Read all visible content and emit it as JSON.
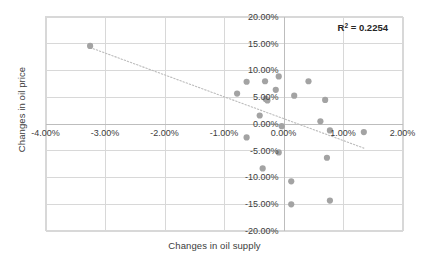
{
  "chart_data": {
    "type": "scatter",
    "title": "",
    "xlabel": "Changes in oil supply",
    "ylabel": "Changes in oil price",
    "xlim": [
      -4.0,
      2.0
    ],
    "ylim": [
      -20.0,
      20.0
    ],
    "x_ticks": [
      -4.0,
      -3.0,
      -2.0,
      -1.0,
      0.0,
      1.0,
      2.0
    ],
    "x_tick_labels": [
      "-4.00%",
      "-3.00%",
      "-2.00%",
      "-1.00%",
      "0.00%",
      "1.00%",
      "2.00%"
    ],
    "y_ticks": [
      20.0,
      15.0,
      10.0,
      5.0,
      0.0,
      -5.0,
      -10.0,
      -15.0,
      -20.0
    ],
    "y_tick_labels": [
      "20.00%",
      "15.00%",
      "10.00%",
      "5.00%",
      "0.00%",
      "-5.00%",
      "-10.00%",
      "-15.00%",
      "-20.00%"
    ],
    "grid": true,
    "legend": false,
    "annotation": "R² = 0.2254",
    "annotation_prefix": "R",
    "annotation_superscript": "2",
    "annotation_suffix": " = 0.2254",
    "r_squared": 0.2254,
    "marker_color": "#a3a3a3",
    "gridline_color": "#d8d8d8",
    "trendline_color": "#bcbcbc",
    "trendline": {
      "style": "dotted",
      "x_start": -3.25,
      "y_start": 14.2,
      "x_end": 1.35,
      "y_end": -4.6
    },
    "points": [
      {
        "x": -3.25,
        "y": 14.5
      },
      {
        "x": -0.62,
        "y": 7.8
      },
      {
        "x": -0.31,
        "y": 7.9
      },
      {
        "x": -0.08,
        "y": 8.8
      },
      {
        "x": -0.78,
        "y": 5.6
      },
      {
        "x": -0.13,
        "y": 6.3
      },
      {
        "x": -0.3,
        "y": 4.6
      },
      {
        "x": -0.27,
        "y": 4.3
      },
      {
        "x": -0.4,
        "y": 1.5
      },
      {
        "x": 0.18,
        "y": 5.2
      },
      {
        "x": 0.42,
        "y": 7.9
      },
      {
        "x": 0.7,
        "y": 4.4
      },
      {
        "x": 0.62,
        "y": 0.4
      },
      {
        "x": -0.03,
        "y": -0.5
      },
      {
        "x": 0.78,
        "y": -1.3
      },
      {
        "x": 1.35,
        "y": -1.6
      },
      {
        "x": -0.62,
        "y": -2.6
      },
      {
        "x": -0.08,
        "y": -5.4
      },
      {
        "x": -0.35,
        "y": -8.4
      },
      {
        "x": 0.73,
        "y": -6.4
      },
      {
        "x": 0.13,
        "y": -10.8
      },
      {
        "x": 0.13,
        "y": -15.1
      },
      {
        "x": 0.78,
        "y": -14.4
      }
    ]
  }
}
